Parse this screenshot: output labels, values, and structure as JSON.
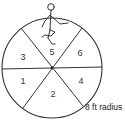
{
  "diagram": {
    "type": "circle-divided-into-sectors",
    "sector_count": 6,
    "sectors": [
      {
        "label": "1",
        "x": 23,
        "y": 84
      },
      {
        "label": "2",
        "x": 53,
        "y": 97
      },
      {
        "label": "3",
        "x": 23,
        "y": 60
      },
      {
        "label": "4",
        "x": 81,
        "y": 84
      },
      {
        "label": "5",
        "x": 52,
        "y": 55
      },
      {
        "label": "6",
        "x": 80,
        "y": 56
      }
    ],
    "radius_label": "8 ft radius",
    "figure": "stick-figure-standing-on-one-leg",
    "stroke_color": "#333333"
  }
}
